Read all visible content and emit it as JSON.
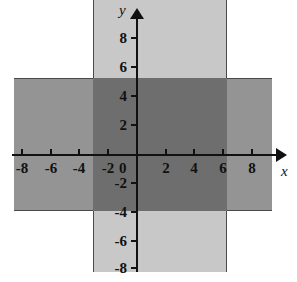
{
  "chart_data": {
    "type": "area",
    "title": "",
    "xlabel": "x",
    "ylabel": "y",
    "xlim": [
      -9.5,
      9.5
    ],
    "ylim": [
      -9.5,
      9.5
    ],
    "grid": false,
    "legend": "none",
    "x_ticks": [
      -8,
      -6,
      -4,
      -2,
      0,
      2,
      4,
      6,
      8
    ],
    "y_ticks": [
      8,
      6,
      4,
      2,
      0,
      -2,
      -4,
      -6,
      -8
    ],
    "x_tick_labels": [
      "-8",
      "-6",
      "-4",
      "-2",
      "0",
      "2",
      "4",
      "6",
      "8"
    ],
    "y_tick_labels": [
      "8",
      "6",
      "4",
      "2",
      "0",
      "-2",
      "-4",
      "-6",
      "-8"
    ],
    "regions": [
      {
        "name": "vertical-band",
        "description": "vertical strip -3 <= x <= 6",
        "x_range": [
          -3,
          6
        ],
        "y_range": [
          -9.5,
          9.5
        ],
        "color": "#c8c8c8"
      },
      {
        "name": "horizontal-band",
        "description": "horizontal strip -4 <= y <= 5",
        "x_range": [
          -9.0,
          9.5
        ],
        "y_range": [
          -4,
          5
        ],
        "color": "#949494"
      },
      {
        "name": "overlap-region",
        "description": "intersection -3 <= x <= 6 and -4 <= y <= 5",
        "x_range": [
          -3,
          6
        ],
        "y_range": [
          -4,
          5
        ],
        "color": "#6e6e6e"
      }
    ]
  },
  "axes": {
    "x_axis_label": "x",
    "y_axis_label": "y",
    "origin_label": "0"
  },
  "ticks": {
    "x": [
      {
        "value": -8,
        "label": "-8",
        "px": 22
      },
      {
        "value": -6,
        "label": "-6",
        "px": 51
      },
      {
        "value": -4,
        "label": "-4",
        "px": 79
      },
      {
        "value": -2,
        "label": "-2",
        "px": 108
      },
      {
        "value": 2,
        "label": "2",
        "px": 166
      },
      {
        "value": 4,
        "label": "4",
        "px": 194
      },
      {
        "value": 6,
        "label": "6",
        "px": 223
      },
      {
        "value": 8,
        "label": "8",
        "px": 252
      }
    ],
    "y": [
      {
        "value": 8,
        "label": "8",
        "px": 38
      },
      {
        "value": 6,
        "label": "6",
        "px": 67
      },
      {
        "value": 4,
        "label": "4",
        "px": 96
      },
      {
        "value": 2,
        "label": "2",
        "px": 125
      },
      {
        "value": -2,
        "label": "-2",
        "px": 183
      },
      {
        "value": -4,
        "label": "-4",
        "px": 212
      },
      {
        "value": -6,
        "label": "-6",
        "px": 241
      },
      {
        "value": -8,
        "label": "-8",
        "px": 268
      }
    ]
  },
  "colors": {
    "axis": "#111111",
    "light_band": "#c8c8c8",
    "medium_band": "#949494",
    "overlap_band": "#6e6e6e",
    "background": "#ffffff"
  }
}
